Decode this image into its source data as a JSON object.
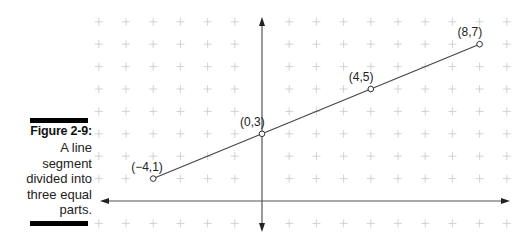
{
  "caption": {
    "title": "Figure 2-9:",
    "text": "A line\nsegment\ndivided into\nthree equal\nparts."
  },
  "colors": {
    "grid": "#c8c8c8",
    "axis": "#555555",
    "line": "#444444",
    "bar": "#000000"
  },
  "chart_data": {
    "type": "line",
    "title": "A line segment divided into three equal parts",
    "grid": true,
    "xlim": [
      -6,
      9
    ],
    "ylim": [
      -1,
      8
    ],
    "points": [
      {
        "x": -4,
        "y": 1,
        "label": "(−4,1)"
      },
      {
        "x": 0,
        "y": 3,
        "label": "(0,3)"
      },
      {
        "x": 4,
        "y": 5,
        "label": "(4,5)"
      },
      {
        "x": 8,
        "y": 7,
        "label": "(8,7)"
      }
    ],
    "segment": {
      "from": [
        -4,
        1
      ],
      "to": [
        8,
        7
      ]
    }
  }
}
